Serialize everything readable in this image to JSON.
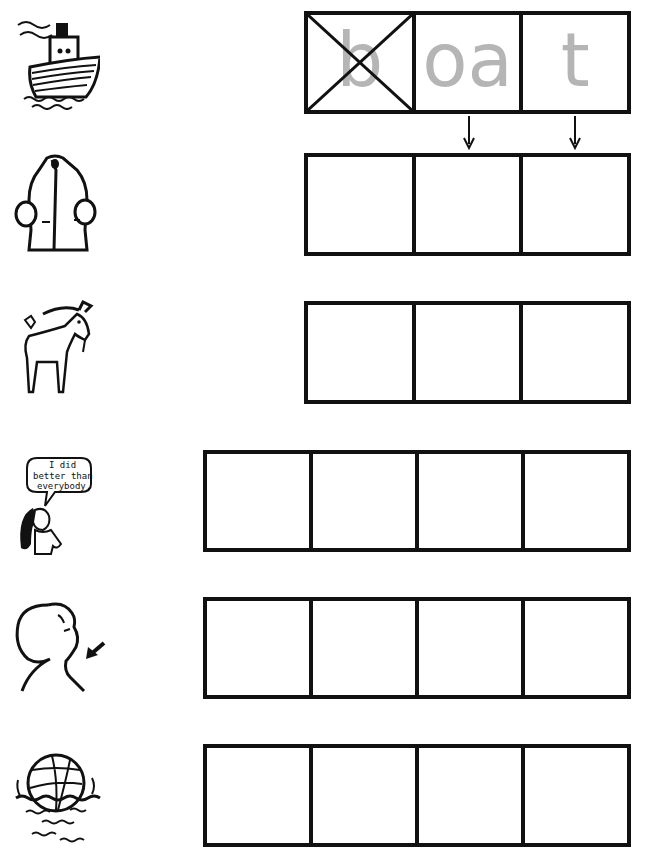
{
  "worksheet": {
    "example": {
      "picture": "boat",
      "boxes": [
        {
          "text": "b",
          "crossed_out": true
        },
        {
          "text": "oa",
          "crossed_out": false
        },
        {
          "text": "t",
          "crossed_out": false
        }
      ]
    },
    "rows": [
      {
        "picture": "boat",
        "box_count": 3
      },
      {
        "picture": "coat",
        "box_count": 3
      },
      {
        "picture": "goat",
        "box_count": 3
      },
      {
        "picture": "boast (girl saying 'I did better than everybody.')",
        "box_count": 4
      },
      {
        "picture": "throat",
        "box_count": 4
      },
      {
        "picture": "float (ball floating on water)",
        "box_count": 4
      }
    ],
    "speech_bubble": {
      "line1": "I did",
      "line2": "better than",
      "line3": "everybody."
    },
    "colors": {
      "ink": "#111111",
      "hint_letters": "#b5b5b5",
      "paper": "#ffffff"
    }
  }
}
